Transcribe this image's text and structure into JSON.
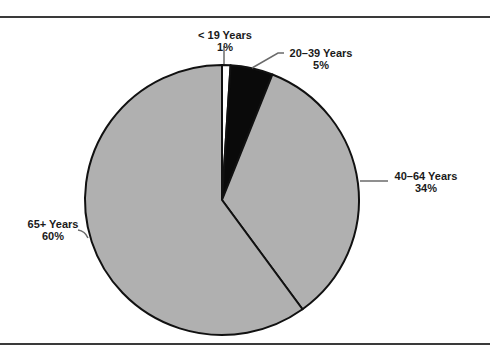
{
  "chart_data": {
    "type": "pie",
    "title": "",
    "categories": [
      "< 19 Years",
      "20–39 Years",
      "40–64 Years",
      "65+ Years"
    ],
    "values": [
      1,
      5,
      34,
      60
    ],
    "value_labels": [
      "1%",
      "5%",
      "34%",
      "60%"
    ],
    "colors": [
      "#ffffff",
      "#0a0a0a",
      "#b0b0b0",
      "#b0b0b0"
    ],
    "start_angle_deg": 0,
    "direction": "clockwise",
    "legend": "none (direct labels with leader lines)"
  },
  "labels": {
    "under19": {
      "name": "< 19 Years",
      "pct": "1%"
    },
    "age20_39": {
      "name": "20–39 Years",
      "pct": "5%"
    },
    "age40_64": {
      "name": "40–64 Years",
      "pct": "34%"
    },
    "age65plus": {
      "name": "65+ Years",
      "pct": "60%"
    }
  },
  "colors": {
    "slice_stroke": "#111111",
    "rule": "#3a3a3a",
    "leader": "#6a6a6a"
  }
}
